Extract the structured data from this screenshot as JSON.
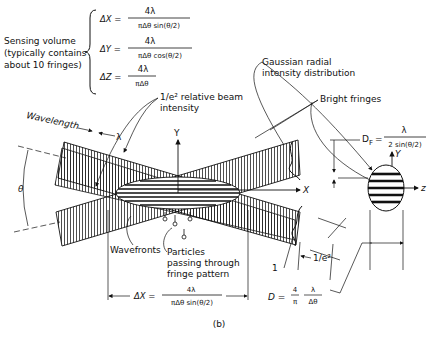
{
  "sensing_volume": {
    "label_lines": [
      "Sensing volume",
      "(typically contains",
      "about 10 fringes)"
    ],
    "dx": {
      "lhs": "ΔX =",
      "num": "4λ",
      "den": "πΔθ sin(θ/2)"
    },
    "dy": {
      "lhs": "ΔY =",
      "num": "4λ",
      "den": "πΔθ cos(θ/2)"
    },
    "dz": {
      "lhs": "ΔZ =",
      "num": "4λ",
      "den": "πΔθ"
    }
  },
  "labels": {
    "gaussian": [
      "Gaussian radial",
      "intensity distribution"
    ],
    "beam_intensity": [
      "1/e² relative beam",
      "intensity"
    ],
    "bright_fringes": "Bright fringes",
    "wavelength": "Wavelength",
    "lambda": "λ",
    "theta": "θ",
    "y_axis": "Y",
    "x_axis": "X",
    "y_axis_right": "Y",
    "z_axis": "z",
    "wavefronts": "Wavefronts",
    "particles": [
      "Particles",
      "passing through",
      "fringe pattern"
    ],
    "one": "1",
    "one_e2": "1/e²",
    "caption": "(b)"
  },
  "fringe_spacing": {
    "lhs": "D",
    "sub": "F",
    "eq": "=",
    "num": "λ",
    "den": "2 sin(θ/2)"
  },
  "beam_diameter": {
    "lhs": "D =",
    "num1": "4",
    "den1": "π",
    "num2": "λ",
    "den2": "Δθ"
  },
  "bottom_dx": {
    "lhs": "ΔX =",
    "num": "4λ",
    "den": "πΔθ sin(θ/2)"
  }
}
